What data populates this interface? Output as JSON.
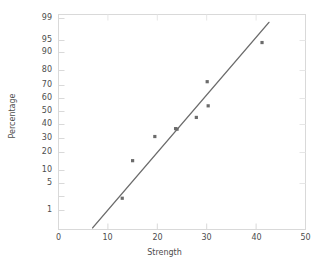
{
  "chart_data": {
    "type": "scatter",
    "title": "",
    "xlabel": "Strength",
    "ylabel": "Percentage",
    "xlim": [
      0,
      50
    ],
    "xticks": [
      0,
      10,
      20,
      30,
      40,
      50
    ],
    "yscale": "normal-probability",
    "ylim": [
      0.4,
      99.6
    ],
    "yticks": [
      1,
      5,
      10,
      20,
      30,
      40,
      50,
      60,
      70,
      80,
      90,
      95,
      99
    ],
    "ytick_labels": [
      "1",
      "5",
      "10",
      "20",
      "30",
      "40",
      "50",
      "60",
      "70",
      "80",
      "90",
      "95",
      "99"
    ],
    "xtick_labels": [
      "0",
      "10",
      "20",
      "30",
      "40",
      "50"
    ],
    "grid": false,
    "legend": "none",
    "marker_color": "#6b6b6b",
    "line_color": "#6b6b6b",
    "frame_color": "#d9d9d9",
    "points": [
      {
        "x": 12.9,
        "y": 3.0
      },
      {
        "x": 15.0,
        "y": 17.0
      },
      {
        "x": 19.5,
        "y": 36.0
      },
      {
        "x": 23.7,
        "y": 43.5
      },
      {
        "x": 24.0,
        "y": 43.0
      },
      {
        "x": 27.9,
        "y": 54.5
      },
      {
        "x": 30.3,
        "y": 65.5
      },
      {
        "x": 30.1,
        "y": 84.0
      },
      {
        "x": 41.2,
        "y": 97.5
      }
    ],
    "fit_line": {
      "x_start": 6.9,
      "y_start": 0.45,
      "x_end": 42.6,
      "y_end": 99.3
    }
  },
  "axes": {
    "x_title": "Strength",
    "y_title": "Percentage"
  }
}
